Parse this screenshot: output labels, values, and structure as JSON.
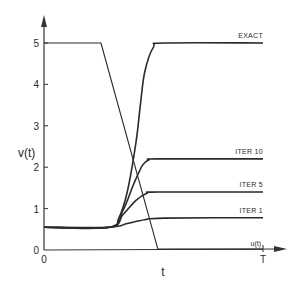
{
  "chart_data": {
    "type": "line",
    "title": "",
    "xlabel": "t",
    "ylabel": "v(t)",
    "xlim": [
      0,
      1
    ],
    "ylim": [
      0,
      5.5
    ],
    "grid": false,
    "legend_position": "inline-right",
    "x_tick_labels": [
      {
        "label": "0",
        "x": 0
      },
      {
        "label": "T",
        "x": 1
      }
    ],
    "y_ticks": [
      0,
      1,
      2,
      3,
      4,
      5
    ],
    "y_tick_labels": [
      "0",
      "1",
      "2",
      "3",
      "4",
      "5"
    ],
    "series": [
      {
        "name": "EXACT",
        "label": "EXACT",
        "x": [
          0,
          0.3,
          0.34,
          0.38,
          0.42,
          0.44,
          0.46,
          0.5,
          0.55,
          1.0
        ],
        "values": [
          0.55,
          0.55,
          0.75,
          1.4,
          2.6,
          3.5,
          4.3,
          4.9,
          5.0,
          5.0
        ]
      },
      {
        "name": "ITER 10",
        "label": "ITER 10",
        "x": [
          0,
          0.3,
          0.36,
          0.41,
          0.45,
          0.48,
          0.52,
          1.0
        ],
        "values": [
          0.55,
          0.55,
          0.95,
          1.6,
          2.05,
          2.18,
          2.2,
          2.2
        ]
      },
      {
        "name": "ITER 5",
        "label": "ITER 5",
        "x": [
          0,
          0.3,
          0.36,
          0.42,
          0.47,
          0.52,
          1.0
        ],
        "values": [
          0.55,
          0.55,
          0.85,
          1.2,
          1.37,
          1.4,
          1.4
        ]
      },
      {
        "name": "ITER 1",
        "label": "ITER 1",
        "x": [
          0,
          0.3,
          0.38,
          0.46,
          0.55,
          1.0
        ],
        "values": [
          0.55,
          0.55,
          0.64,
          0.73,
          0.77,
          0.78
        ]
      },
      {
        "name": "u(t)",
        "label": "u(t)",
        "x": [
          0,
          0.26,
          0.52,
          1.0
        ],
        "values": [
          5.0,
          5.0,
          0.02,
          0.02
        ]
      }
    ]
  }
}
